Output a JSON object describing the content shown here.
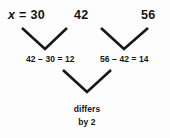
{
  "diagram": {
    "background_color": "#fdfdfd",
    "stroke_color": "#161616",
    "top_row": {
      "first_label_var": "x",
      "first_label_rest": " = 30",
      "first_value": "30",
      "second_value": "42",
      "third_value": "56"
    },
    "middle_row": {
      "left_equation": "42 – 30 = 12",
      "right_equation": "56 – 42 = 14",
      "left_result": "12",
      "right_result": "14"
    },
    "conclusion": {
      "line1": "differs",
      "line2": "by 2"
    },
    "connectors": [
      {
        "name": "chevron-left",
        "x1": 22,
        "y1": 28,
        "apex_x": 45,
        "apex_y": 49,
        "x2": 67,
        "y2": 28
      },
      {
        "name": "chevron-right",
        "x1": 101,
        "y1": 28,
        "apex_x": 124,
        "apex_y": 49,
        "x2": 148,
        "y2": 28
      },
      {
        "name": "chevron-bottom",
        "x1": 63,
        "y1": 70,
        "apex_x": 87,
        "apex_y": 92,
        "x2": 111,
        "y2": 70
      }
    ]
  }
}
